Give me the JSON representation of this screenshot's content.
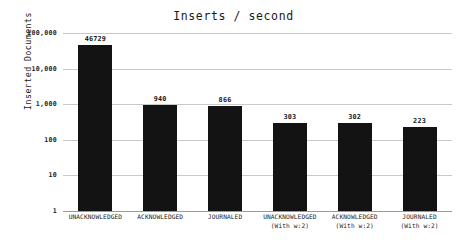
{
  "chart_data": {
    "type": "bar",
    "title": "Inserts / second",
    "xlabel": "",
    "ylabel": "Inserted Documents",
    "yscale": "log",
    "ylim": [
      1,
      100000
    ],
    "grid": true,
    "legend": false,
    "orientation": "vertical",
    "bar_color": "#131313",
    "categories": [
      "UNACKNOWLEDGED",
      "ACKNOWLEDGED",
      "JOURNALED",
      "UNACKNOWLEDGED (With w:2)",
      "ACKNOWLEDGED (With w:2)",
      "JOURNALED (With w:2)"
    ],
    "category_lines": [
      {
        "line1": "UNACKNOWLEDGED",
        "line2": ""
      },
      {
        "line1": "ACKNOWLEDGED",
        "line2": ""
      },
      {
        "line1": "JOURNALED",
        "line2": ""
      },
      {
        "line1": "UNACKNOWLEDGED",
        "line2": "(With w:2)"
      },
      {
        "line1": "ACKNOWLEDGED",
        "line2": "(With w:2)"
      },
      {
        "line1": "JOURNALED",
        "line2": "(With w:2)"
      }
    ],
    "values": [
      46729,
      940,
      866,
      303,
      302,
      223
    ],
    "value_labels": [
      "46729",
      "940",
      "866",
      "303",
      "302",
      "223"
    ],
    "yticks": [
      1,
      10,
      100,
      1000,
      10000,
      100000
    ],
    "ytick_labels": [
      "1",
      "10",
      "100",
      "1,000",
      "10,000",
      "100,000"
    ]
  }
}
